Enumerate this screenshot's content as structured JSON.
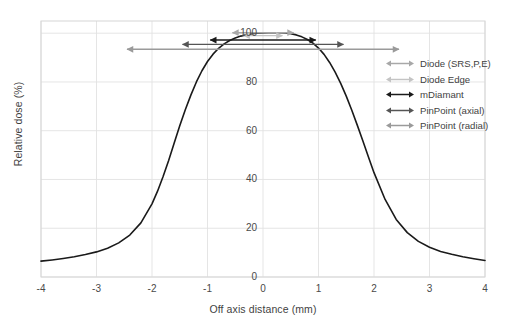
{
  "chart_data": {
    "type": "line",
    "title": "",
    "xlabel": "Off axis distance (mm)",
    "ylabel": "Relative dose (%)",
    "xlim": [
      -4,
      4
    ],
    "ylim": [
      0,
      105
    ],
    "xticks": [
      "-4",
      "-3",
      "-2",
      "-1",
      "0",
      "1",
      "2",
      "3",
      "4"
    ],
    "xtick_values": [
      -4,
      -3,
      -2,
      -1,
      0,
      1,
      2,
      3,
      4
    ],
    "yticks": [
      "0",
      "20",
      "40",
      "60",
      "80",
      "100"
    ],
    "ytick_values": [
      0,
      20,
      40,
      60,
      80,
      100
    ],
    "grid": true,
    "legend_position": "upper right outside",
    "series": [
      {
        "name": "profile",
        "color": "#1a1a1a",
        "x": [
          -4.0,
          -3.8,
          -3.6,
          -3.4,
          -3.2,
          -3.0,
          -2.8,
          -2.6,
          -2.4,
          -2.2,
          -2.0,
          -1.9,
          -1.8,
          -1.7,
          -1.6,
          -1.5,
          -1.4,
          -1.3,
          -1.2,
          -1.1,
          -1.0,
          -0.9,
          -0.8,
          -0.7,
          -0.6,
          -0.5,
          -0.4,
          -0.3,
          -0.2,
          -0.1,
          0.0,
          0.1,
          0.2,
          0.3,
          0.4,
          0.5,
          0.6,
          0.7,
          0.8,
          0.9,
          1.0,
          1.1,
          1.2,
          1.3,
          1.4,
          1.5,
          1.6,
          1.7,
          1.8,
          1.9,
          2.0,
          2.2,
          2.4,
          2.6,
          2.8,
          3.0,
          3.2,
          3.4,
          3.6,
          3.8,
          4.0
        ],
        "y": [
          6.5,
          7.0,
          7.6,
          8.3,
          9.2,
          10.3,
          11.8,
          14.0,
          17.2,
          22.2,
          30.0,
          35.2,
          41.2,
          47.8,
          55.0,
          62.0,
          68.6,
          74.6,
          80.0,
          84.6,
          88.4,
          91.4,
          93.8,
          95.6,
          97.0,
          98.0,
          98.8,
          99.4,
          99.8,
          100.0,
          100.1,
          100.2,
          100.2,
          100.2,
          100.1,
          99.8,
          99.3,
          98.5,
          97.4,
          95.9,
          93.9,
          91.3,
          88.0,
          84.0,
          79.4,
          74.2,
          68.4,
          62.2,
          55.8,
          49.2,
          42.8,
          31.8,
          23.6,
          18.2,
          14.6,
          12.2,
          10.5,
          9.3,
          8.3,
          7.5,
          6.8
        ]
      }
    ],
    "annotations": [
      {
        "label": "Diode (SRS,P,E)",
        "x_start": -0.55,
        "x_end": 0.55,
        "y": 100.2,
        "color": "#a8a8a8"
      },
      {
        "label": "Diode Edge",
        "x_start": -0.35,
        "x_end": 0.35,
        "y": 99.0,
        "color": "#c4c4c4"
      },
      {
        "label": "mDiamant",
        "x_start": -0.95,
        "x_end": 0.95,
        "y": 97.2,
        "color": "#1a1a1a"
      },
      {
        "label": "PinPoint (axial)",
        "x_start": -1.45,
        "x_end": 1.45,
        "y": 95.4,
        "color": "#555555"
      },
      {
        "label": "PinPoint (radial)",
        "x_start": -2.45,
        "x_end": 2.45,
        "y": 93.4,
        "color": "#9a9a9a"
      }
    ]
  },
  "legend": {
    "items": [
      {
        "label": "Diode (SRS,P,E)"
      },
      {
        "label": "Diode Edge"
      },
      {
        "label": "mDiamant"
      },
      {
        "label": "PinPoint (axial)"
      },
      {
        "label": "PinPoint (radial)"
      }
    ]
  }
}
